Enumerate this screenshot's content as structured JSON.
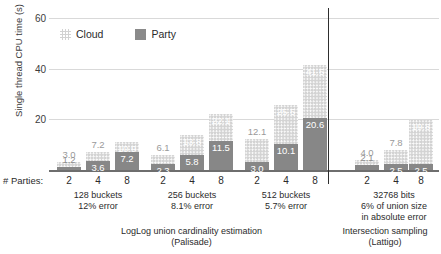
{
  "chart_data": {
    "type": "bar",
    "stacked": true,
    "title": "",
    "xlabel": "# Parties:",
    "ylabel": "Single thread CPU time (s)",
    "ylim": [
      0,
      62
    ],
    "yticks": [
      20,
      40,
      60
    ],
    "grid": true,
    "legend_position": "top-left",
    "legend": [
      "Cloud",
      "Party"
    ],
    "categories": [
      "2",
      "4",
      "8",
      "2",
      "4",
      "8",
      "2",
      "4",
      "8",
      "2",
      "4",
      "8"
    ],
    "series": [
      {
        "name": "Party",
        "values": [
          1.2,
          3.6,
          7.2,
          2.3,
          5.8,
          11.5,
          3.0,
          10.1,
          20.6,
          2.1,
          2.5,
          2.5
        ]
      },
      {
        "name": "Cloud",
        "values": [
          3.0,
          7.2,
          10.9,
          6.1,
          13.8,
          22.1,
          12.1,
          25.5,
          41.5,
          4.0,
          7.8,
          19.8
        ]
      }
    ],
    "groups": [
      {
        "id": "g1",
        "caption_line1": "128 buckets",
        "caption_line2": "12% error",
        "ticks": [
          "2",
          "4",
          "8"
        ],
        "bars": [
          {
            "tick": "2",
            "party": 1.2,
            "cloud": 3.0,
            "party_label": "1.2",
            "cloud_label": "3.0",
            "party_pos": "above-dark",
            "cloud_pos": "above"
          },
          {
            "tick": "4",
            "party": 3.6,
            "cloud": 7.2,
            "party_label": "3.6",
            "cloud_label": "7.2",
            "party_pos": "inside",
            "cloud_pos": "above"
          },
          {
            "tick": "8",
            "party": 7.2,
            "cloud": 10.9,
            "party_label": "7.2",
            "cloud_label": "10.9",
            "party_pos": "inside",
            "cloud_pos": "inside"
          }
        ]
      },
      {
        "id": "g2",
        "caption_line1": "256 buckets",
        "caption_line2": "8.1% error",
        "ticks": [
          "2",
          "4",
          "8"
        ],
        "bars": [
          {
            "tick": "2",
            "party": 2.3,
            "cloud": 6.1,
            "party_label": "2.3",
            "cloud_label": "6.1",
            "party_pos": "inside",
            "cloud_pos": "above"
          },
          {
            "tick": "4",
            "party": 5.8,
            "cloud": 13.8,
            "party_label": "5.8",
            "cloud_label": "13.8",
            "party_pos": "inside",
            "cloud_pos": "inside"
          },
          {
            "tick": "8",
            "party": 11.5,
            "cloud": 22.1,
            "party_label": "11.5",
            "cloud_label": "22.1",
            "party_pos": "inside",
            "cloud_pos": "inside"
          }
        ]
      },
      {
        "id": "g3",
        "caption_line1": "512 buckets",
        "caption_line2": "5.7% error",
        "ticks": [
          "2",
          "4",
          "8"
        ],
        "bars": [
          {
            "tick": "2",
            "party": 3.0,
            "cloud": 12.1,
            "party_label": "3.0",
            "cloud_label": "12.1",
            "party_pos": "inside",
            "cloud_pos": "above"
          },
          {
            "tick": "4",
            "party": 10.1,
            "cloud": 25.5,
            "party_label": "10.1",
            "cloud_label": "25.5",
            "party_pos": "inside",
            "cloud_pos": "inside"
          },
          {
            "tick": "8",
            "party": 20.6,
            "cloud": 41.5,
            "party_label": "20.6",
            "cloud_label": "41.5",
            "party_pos": "inside",
            "cloud_pos": "inside"
          }
        ]
      },
      {
        "id": "g4",
        "caption_line1": "32768 bits",
        "caption_line2": "6% of union size",
        "caption_line3": "in absolute error",
        "ticks": [
          "2",
          "4",
          "8"
        ],
        "bars": [
          {
            "tick": "2",
            "party": 2.1,
            "cloud": 4.0,
            "party_label": "2.1",
            "cloud_label": "4.0",
            "party_pos": "above-dark",
            "cloud_pos": "above"
          },
          {
            "tick": "4",
            "party": 2.5,
            "cloud": 7.8,
            "party_label": "2.5",
            "cloud_label": "7.8",
            "party_pos": "inside",
            "cloud_pos": "above"
          },
          {
            "tick": "8",
            "party": 2.5,
            "cloud": 19.8,
            "party_label": "2.5",
            "cloud_label": "19.8",
            "party_pos": "inside",
            "cloud_pos": "inside"
          }
        ]
      }
    ],
    "section_captions": [
      {
        "id": "s1",
        "line1": "LogLog union cardinality estimation",
        "line2": "(Palisade)"
      },
      {
        "id": "s2",
        "line1": "Intersection sampling",
        "line2": "(Lattigo)"
      }
    ],
    "colors": {
      "cloud": "#d3d3d3",
      "party": "#878787",
      "grid": "#d9d9d9",
      "axis": "#6e6e6e",
      "divider": "#2e2e2e",
      "text": "#2b2b2b"
    }
  }
}
